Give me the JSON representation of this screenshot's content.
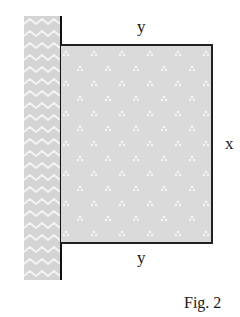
{
  "figure": {
    "caption": "Fig. 2",
    "labels": {
      "top": "y",
      "bottom": "y",
      "right": "x"
    },
    "colors": {
      "wall_fill": "#d6d6d6",
      "plate_fill": "#dcdcdc",
      "outline": "#222222"
    }
  }
}
